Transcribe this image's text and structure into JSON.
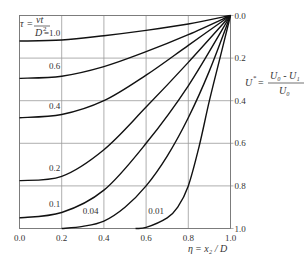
{
  "chart_data": {
    "type": "line",
    "title": "",
    "xlabel": "η = x₂ / D",
    "ylabel": "U* = (U₀ - U₁) / U₀",
    "xlim": [
      0.0,
      1.0
    ],
    "ylim": [
      0.0,
      1.0
    ],
    "y_inverted": true,
    "y_axis_side": "right",
    "grid": true,
    "x_ticks": [
      "0.0",
      "0.2",
      "0.4",
      "0.6",
      "0.8",
      "1.0"
    ],
    "y_ticks": [
      "0.0",
      "0.2",
      "0.4",
      "0.6",
      "0.8",
      "1.0"
    ],
    "parameter_label": {
      "symbol": "τ",
      "eq": "=",
      "num": "νt",
      "den": "D",
      "den_sup": "2",
      "first_value": "=1.0"
    },
    "ylabel_parts": {
      "lhs": "U",
      "lhs_sup": "*",
      "eq": "=",
      "num": "U₀ - U₁",
      "den": "U₀"
    },
    "xlabel_parts": {
      "eta": "η",
      "rest": "= x₂ / D"
    },
    "series": [
      {
        "name": "1.0",
        "label": "",
        "x": [
          0.0,
          0.2,
          0.4,
          0.6,
          0.8,
          1.0
        ],
        "y": [
          0.12,
          0.115,
          0.095,
          0.07,
          0.04,
          0.0
        ]
      },
      {
        "name": "0.6",
        "label": "0.6",
        "x": [
          0.0,
          0.2,
          0.4,
          0.6,
          0.8,
          1.0
        ],
        "y": [
          0.295,
          0.285,
          0.24,
          0.17,
          0.09,
          0.0
        ]
      },
      {
        "name": "0.4",
        "label": "0.4",
        "x": [
          0.0,
          0.2,
          0.4,
          0.6,
          0.8,
          1.0
        ],
        "y": [
          0.48,
          0.465,
          0.4,
          0.28,
          0.14,
          0.0
        ]
      },
      {
        "name": "0.2",
        "label": "0.2",
        "x": [
          0.0,
          0.2,
          0.4,
          0.6,
          0.8,
          1.0
        ],
        "y": [
          0.775,
          0.755,
          0.63,
          0.43,
          0.22,
          0.0
        ]
      },
      {
        "name": "0.1",
        "label": "0.1",
        "x": [
          0.0,
          0.2,
          0.4,
          0.6,
          0.8,
          1.0
        ],
        "y": [
          0.95,
          0.925,
          0.82,
          0.6,
          0.33,
          0.0
        ]
      },
      {
        "name": "0.04",
        "label": "0.04",
        "x": [
          0.2,
          0.3,
          0.4,
          0.5,
          0.6,
          0.7,
          0.8,
          0.9,
          1.0
        ],
        "y": [
          1.0,
          0.99,
          0.965,
          0.9,
          0.8,
          0.66,
          0.48,
          0.26,
          0.0
        ]
      },
      {
        "name": "0.01",
        "label": "0.01",
        "x": [
          0.55,
          0.6,
          0.7,
          0.75,
          0.8,
          0.85,
          0.9,
          0.95,
          1.0
        ],
        "y": [
          1.0,
          0.995,
          0.95,
          0.9,
          0.8,
          0.62,
          0.4,
          0.2,
          0.0
        ]
      }
    ]
  }
}
